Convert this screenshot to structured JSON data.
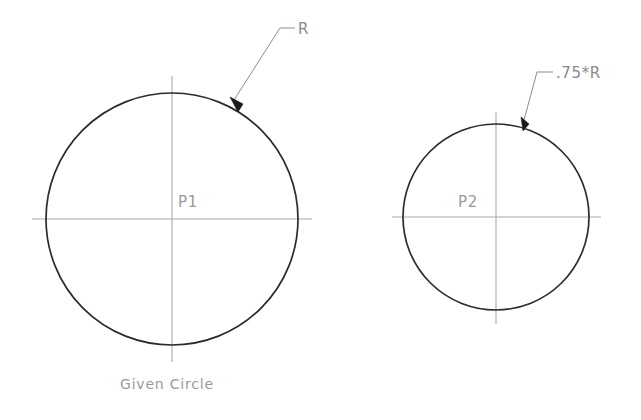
{
  "drawing": {
    "title": "Given Circle",
    "background_color": "#ffffff",
    "outline_color": "#2b2b2b",
    "centerline_color": "#a9a9a9",
    "leader_color": "#8d8d8d",
    "text_color": "#9a9a9a",
    "figures": [
      {
        "id": "left",
        "point_label": "P1",
        "dimension_label": "R",
        "center_x": 172,
        "center_y": 219,
        "radius": 126,
        "caption": "Given Circle"
      },
      {
        "id": "right",
        "point_label": "P2",
        "dimension_label": ".75*R",
        "center_x": 496,
        "center_y": 217,
        "radius": 93,
        "caption": ""
      }
    ]
  },
  "labels": {
    "radius_r": "R",
    "radius_075r": ".75*R",
    "point_p1": "P1",
    "point_p2": "P2",
    "caption_given_circle": "Given  Circle"
  }
}
